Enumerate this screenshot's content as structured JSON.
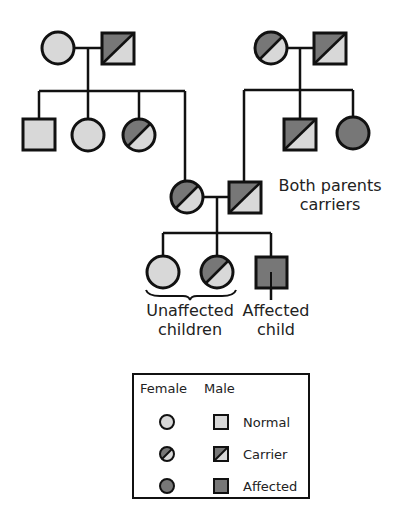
{
  "colors": {
    "normal": "#d8d8d8",
    "affected": "#777777",
    "stroke": "#111111"
  },
  "annotations": {
    "both_parents_line1": "Both parents",
    "both_parents_line2": "carriers",
    "unaffected_line1": "Unaffected",
    "unaffected_line2": "children",
    "affected_line1": "Affected",
    "affected_line2": "child"
  },
  "legend": {
    "col_female": "Female",
    "col_male": "Male",
    "rows": [
      {
        "label": "Normal"
      },
      {
        "label": "Carrier"
      },
      {
        "label": "Affected"
      }
    ]
  },
  "pedigree": {
    "generation1_left": [
      {
        "sex": "female",
        "status": "normal"
      },
      {
        "sex": "male",
        "status": "carrier"
      }
    ],
    "generation1_right": [
      {
        "sex": "female",
        "status": "carrier"
      },
      {
        "sex": "male",
        "status": "carrier"
      }
    ],
    "generation2_left_children": [
      {
        "sex": "male",
        "status": "normal"
      },
      {
        "sex": "female",
        "status": "normal"
      },
      {
        "sex": "female",
        "status": "carrier"
      },
      {
        "sex": "female",
        "status": "carrier"
      }
    ],
    "generation2_right_children": [
      {
        "sex": "male",
        "status": "carrier"
      },
      {
        "sex": "male",
        "status": "carrier"
      },
      {
        "sex": "female",
        "status": "affected"
      }
    ],
    "generation3_children": [
      {
        "sex": "female",
        "status": "normal"
      },
      {
        "sex": "female",
        "status": "carrier"
      },
      {
        "sex": "male",
        "status": "affected"
      }
    ]
  }
}
